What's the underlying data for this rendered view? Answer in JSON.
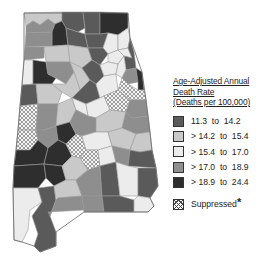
{
  "legend": {
    "title_lines": [
      "Age-Adjusted Annual",
      "Death Rate",
      "(Deaths per 100,000)"
    ],
    "items": [
      {
        "label": "11.3  to  14.2",
        "color": "#5a5a5a"
      },
      {
        "label": "> 14.2  to  15.4",
        "color": "#c9c9c9"
      },
      {
        "label": "> 15.4  to  17.0",
        "color": "#ececec"
      },
      {
        "label": "> 17.0  to  18.9",
        "color": "#8e8e8e"
      },
      {
        "label": "> 18.9  to  24.4",
        "color": "#2e2e2e"
      }
    ],
    "suppressed_label": "Suppressed",
    "suppressed_mark": "*"
  },
  "map": {
    "region": "Alabama",
    "classes": {
      "c1": "#5a5a5a",
      "c2": "#c9c9c9",
      "c3": "#ececec",
      "c4": "#8e8e8e",
      "c5": "#2e2e2e"
    }
  }
}
